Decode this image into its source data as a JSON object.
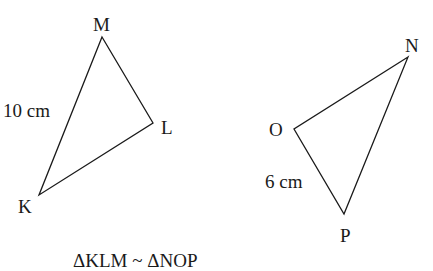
{
  "triangles": [
    {
      "name": "KLM",
      "vertices": {
        "M": {
          "label": "M",
          "x": 102,
          "y": 37
        },
        "L": {
          "label": "L",
          "x": 153,
          "y": 123
        },
        "K": {
          "label": "K",
          "x": 39,
          "y": 195
        }
      },
      "side_label": "10 cm",
      "side": "KM"
    },
    {
      "name": "NOP",
      "vertices": {
        "N": {
          "label": "N",
          "x": 408,
          "y": 57
        },
        "O": {
          "label": "O",
          "x": 294,
          "y": 129
        },
        "P": {
          "label": "P",
          "x": 344,
          "y": 214
        }
      },
      "side_label": "6 cm",
      "side": "OP"
    }
  ],
  "labels": {
    "M": "M",
    "L": "L",
    "K": "K",
    "N": "N",
    "O": "O",
    "P": "P",
    "km": "10 cm",
    "op": "6 cm",
    "similarity": "ΔKLM ~ ΔNOP"
  },
  "colors": {
    "stroke": "#1a1a1a",
    "background": "#ffffff"
  }
}
